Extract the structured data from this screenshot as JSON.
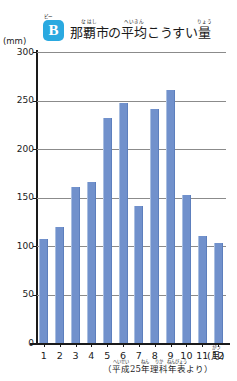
{
  "logo": {
    "letter": "B",
    "furigana": "ビー",
    "color": "#2aa9e0"
  },
  "title": {
    "full": "那覇市の平均こうすい量",
    "segments": [
      {
        "base": "那覇市",
        "ruby": "なはし"
      },
      {
        "base": "の",
        "ruby": ""
      },
      {
        "base": "平均",
        "ruby": "へいきん"
      },
      {
        "base": "こうすい",
        "ruby": ""
      },
      {
        "base": "量",
        "ruby": "りょう"
      }
    ]
  },
  "source": {
    "open": "（",
    "segments": [
      {
        "base": "平成",
        "ruby": "へいせい"
      },
      {
        "base": "25",
        "ruby": ""
      },
      {
        "base": "年",
        "ruby": "ねん"
      },
      {
        "base": "理科",
        "ruby": "りか"
      },
      {
        "base": "年表",
        "ruby": "ねんぴょう"
      },
      {
        "base": "より",
        "ruby": ""
      }
    ],
    "close": "）",
    "full": "（平成25年理科年表より）"
  },
  "chart_data": {
    "type": "bar",
    "xlabel": "月",
    "ylabel": "mm",
    "unit_label": "(mm)",
    "xunit_label": "(月)",
    "xunit_ruby": "がつ",
    "categories": [
      "1",
      "2",
      "3",
      "4",
      "5",
      "6",
      "7",
      "8",
      "9",
      "10",
      "11",
      "12"
    ],
    "values": [
      107,
      120,
      161,
      166,
      232,
      247,
      141,
      241,
      261,
      153,
      110,
      103
    ],
    "ylim": [
      0,
      300
    ],
    "yticks": [
      0,
      50,
      100,
      150,
      200,
      250,
      300
    ],
    "ytick_labels": [
      "0",
      "50",
      "100",
      "150",
      "200",
      "250",
      "300"
    ],
    "grid": true,
    "legend": "none",
    "bar_color": "#7191cc"
  }
}
